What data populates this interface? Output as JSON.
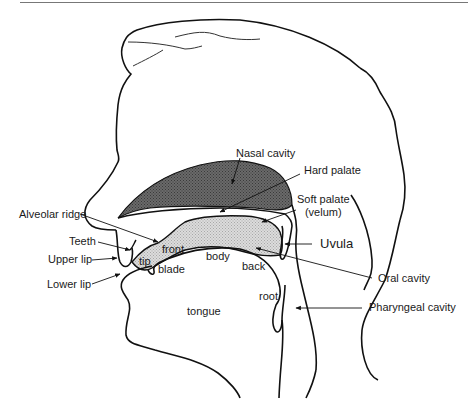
{
  "diagram": {
    "colors": {
      "outline": "#111111",
      "nasal_fill": "#5a5a5a",
      "oral_fill": "#cfcfcf",
      "rule": "#777777"
    },
    "labels": {
      "nasal_cavity": "Nasal cavity",
      "hard_palate": "Hard palate",
      "soft_palate_line1": "Soft palate",
      "soft_palate_line2": "(velum)",
      "alveolar_ridge": "Alveolar ridge",
      "teeth": "Teeth",
      "upper_lip": "Upper lip",
      "lower_lip": "Lower lip",
      "uvula": "Uvula",
      "oral_cavity": "Oral cavity",
      "pharyngeal_cavity": "Pharyngeal cavity",
      "front": "front",
      "tip": "tip",
      "blade": "blade",
      "body": "body",
      "back": "back",
      "root": "root",
      "tongue": "tongue"
    }
  }
}
